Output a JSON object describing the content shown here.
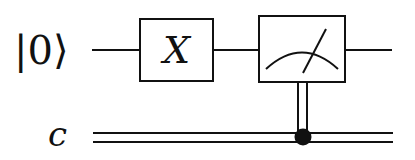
{
  "circuit": {
    "qubit_label": "|0⟩",
    "classical_label": "c",
    "gates": [
      {
        "type": "pauli-x",
        "label": "X"
      },
      {
        "type": "measurement",
        "label": ""
      }
    ],
    "colors": {
      "stroke": "#111111",
      "background": "#ffffff"
    }
  }
}
